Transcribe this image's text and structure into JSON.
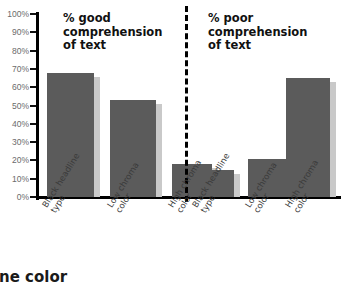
{
  "chart_data": {
    "type": "bar",
    "title": "",
    "panels": [
      {
        "heading": "% good\ncomprehension\nof text",
        "categories": [
          "Black headline\ntype",
          "Low chroma\ncolor",
          "High chroma\ncolor"
        ],
        "values": [
          68,
          53,
          18
        ]
      },
      {
        "heading": "% poor\ncomprehension\nof text",
        "categories": [
          "Black headline\ntype",
          "Low chroma\ncolor",
          "High chroma\ncolor"
        ],
        "values": [
          15,
          21,
          65
        ]
      }
    ],
    "ylabel": "",
    "xlabel": "",
    "ylim": [
      0,
      100
    ],
    "ytick_labels": [
      "100%",
      "90%",
      "80%",
      "70%",
      "60%",
      "50%",
      "40%",
      "30%",
      "20%",
      "10%",
      "0%"
    ],
    "ytick_values": [
      100,
      90,
      80,
      70,
      60,
      50,
      40,
      30,
      20,
      10,
      0
    ],
    "grid": false,
    "legend": "none",
    "bar_color": "#5b5b5b",
    "bar_shadow_color": "#c9c9c9",
    "divider": "dashed-vertical"
  },
  "caption": {
    "bottom_text_clipped": "dline color"
  }
}
